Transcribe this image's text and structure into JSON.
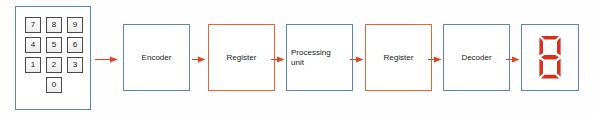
{
  "diagram": {
    "background_color": "#fefefe",
    "colors": {
      "blue_border": "#5b86b5",
      "orange_border": "#e0663c",
      "arrow": "#d8472a",
      "segment_on": "#d8301c",
      "key_border": "#4a4a4a",
      "text": "#1b1b1b"
    },
    "keypad": {
      "name": "numeric-keypad",
      "border_color": "#5b86b5",
      "rows": [
        [
          "7",
          "8",
          "9"
        ],
        [
          "4",
          "5",
          "6"
        ],
        [
          "1",
          "2",
          "3"
        ],
        [
          "0"
        ]
      ]
    },
    "blocks": [
      {
        "label": "Encoder",
        "border_color": "#5b86b5",
        "align": "center",
        "x": 123,
        "width": 67
      },
      {
        "label": "Register",
        "border_color": "#e0663c",
        "align": "center",
        "x": 208,
        "width": 67
      },
      {
        "label": "Processing\nunit",
        "border_color": "#5b86b5",
        "align": "left",
        "x": 286,
        "width": 67
      },
      {
        "label": "Register",
        "border_color": "#e0663c",
        "align": "center",
        "x": 365,
        "width": 67
      },
      {
        "label": "Decoder",
        "border_color": "#5b86b5",
        "align": "center",
        "x": 443,
        "width": 67
      }
    ],
    "display": {
      "label": "seven-segment-display",
      "border_color": "#5b86b5",
      "digit_shown": "8",
      "segments_lit": [
        "a",
        "b",
        "c",
        "d",
        "e",
        "f",
        "g"
      ],
      "segment_color": "#d8301c",
      "x": 521,
      "width": 58
    },
    "arrows": [
      {
        "from": "numeric-keypad",
        "to": "Encoder",
        "x": 95,
        "width": 24
      },
      {
        "from": "Encoder",
        "to": "Register",
        "x": 192,
        "width": 14
      },
      {
        "from": "Register",
        "to": "Processing unit",
        "x": 271,
        "width": 14
      },
      {
        "from": "Processing unit",
        "to": "Register",
        "x": 350,
        "width": 14
      },
      {
        "from": "Register",
        "to": "Decoder",
        "x": 428,
        "width": 14
      },
      {
        "from": "Decoder",
        "to": "seven-segment-display",
        "x": 506,
        "width": 14
      }
    ]
  }
}
